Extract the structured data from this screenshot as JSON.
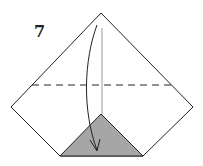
{
  "diagram": {
    "step_number": "7",
    "type": "origami fold instruction",
    "colors": {
      "outline": "#222222",
      "shaded_flap": "#a6a6a6",
      "crease_line": "#bbbbbb",
      "background": "#ffffff"
    },
    "elements": {
      "paper_outline": "pentagon-like folded shape",
      "dashed_fold_line": "horizontal valley fold",
      "arrow": "curved arrow from top apex down to bottom",
      "shaded_triangle": "colored back side flap at bottom"
    }
  }
}
